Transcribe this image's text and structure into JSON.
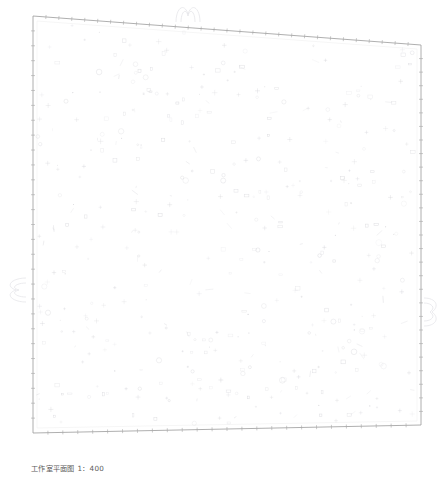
{
  "drawing": {
    "caption": "工作室平面图 1：400",
    "title": "工作室平面图",
    "scale_label": "1：400",
    "type": "architectural-floor-plan",
    "background_color": "#ffffff",
    "line_color": "#9a9a9a",
    "faint_line_color": "#d8d8d8",
    "symbol_color": "#c9c9cf",
    "caption_color": "#5c5c5c",
    "boundary": {
      "name": "site-outline",
      "note": "skewed quadrilateral, top and bottom edges slope down to the right",
      "points": [
        {
          "x": 33,
          "y": 16
        },
        {
          "x": 421,
          "y": 45
        },
        {
          "x": 421,
          "y": 425
        },
        {
          "x": 33,
          "y": 433
        }
      ]
    },
    "edges": [
      {
        "name": "top-edge",
        "ticks": 30,
        "tick_length": 4
      },
      {
        "name": "right-edge",
        "ticks": 28,
        "tick_length": 4
      },
      {
        "name": "bottom-edge",
        "ticks": 26,
        "tick_length": 4
      },
      {
        "name": "left-edge",
        "ticks": 28,
        "tick_length": 4
      }
    ],
    "exterior_symbols": [
      {
        "name": "tree-symbol-top",
        "x": 188,
        "y": 11
      },
      {
        "name": "tree-symbol-left",
        "x": 14,
        "y": 295
      },
      {
        "name": "tree-symbol-right",
        "x": 430,
        "y": 312
      }
    ],
    "interior_symbol_count": 420,
    "interior_symbol_note": "sparse scattered furniture / fixture marks filling the plan"
  }
}
